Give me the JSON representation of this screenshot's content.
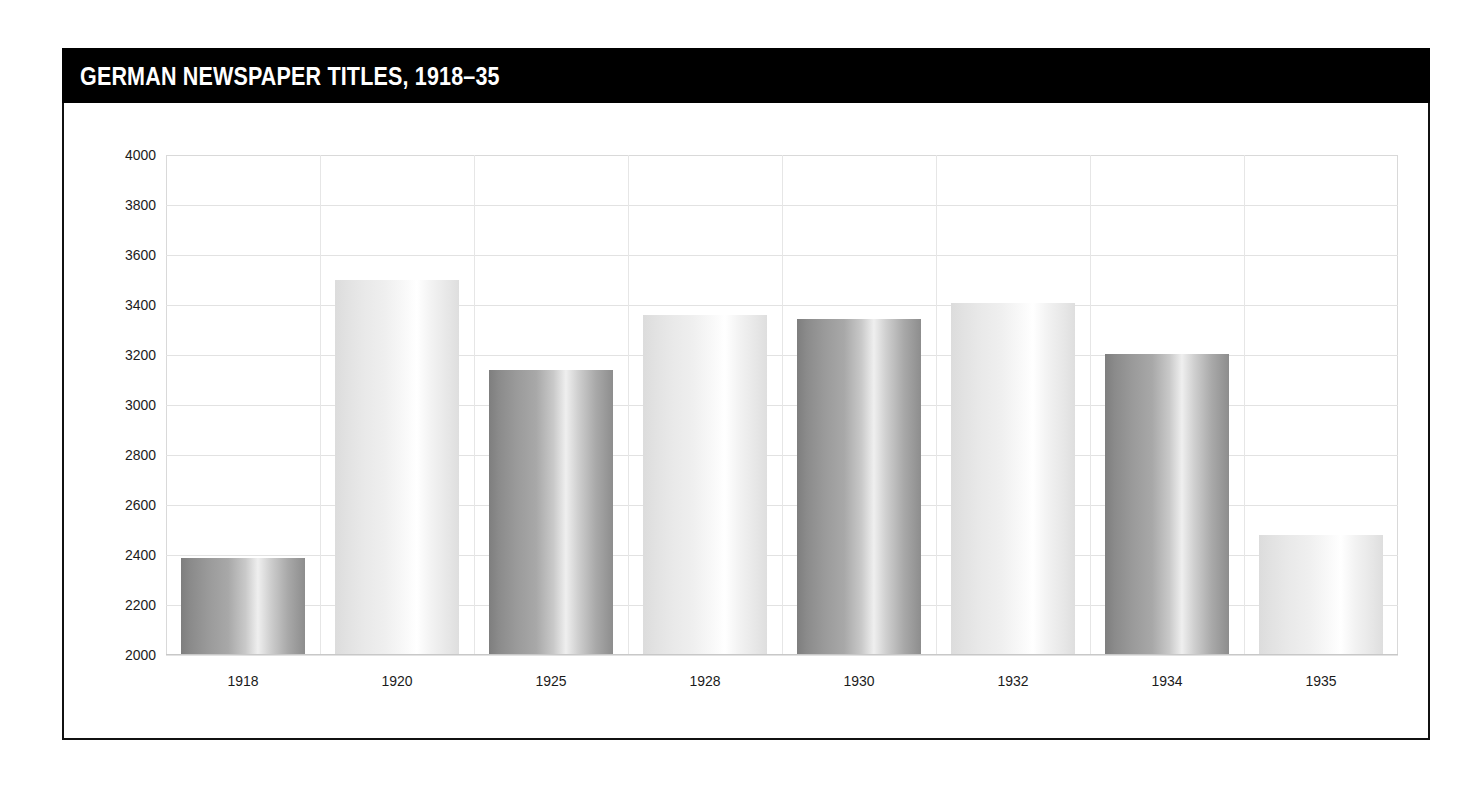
{
  "figure": {
    "title": "GERMAN NEWSPAPER TITLES, 1918–35",
    "title_bar_color": "#000000",
    "title_text_color": "#ffffff",
    "frame_border_color": "#111111",
    "background_color": "#ffffff"
  },
  "chart_data": {
    "type": "bar",
    "title": "GERMAN NEWSPAPER TITLES, 1918–35",
    "xlabel": "",
    "ylabel": "",
    "categories": [
      "1918",
      "1920",
      "1925",
      "1928",
      "1930",
      "1932",
      "1934",
      "1935"
    ],
    "values": [
      2390,
      3500,
      3140,
      3360,
      3345,
      3410,
      3205,
      2480
    ],
    "ylim": [
      2000,
      4000
    ],
    "ytick_step": 200,
    "yticks": [
      "4000",
      "3800",
      "3600",
      "3400",
      "3200",
      "3000",
      "2800",
      "2600",
      "2400",
      "2200",
      "2000"
    ],
    "grid": true,
    "grid_color": "#e2e2e2",
    "legend": false,
    "legend_position": "none",
    "bar_styles": [
      "dark",
      "light",
      "dark",
      "light",
      "dark",
      "light",
      "dark",
      "light"
    ],
    "bar_dark_color": "#9a9a9a",
    "bar_light_color": "#ececec",
    "annotations": []
  }
}
